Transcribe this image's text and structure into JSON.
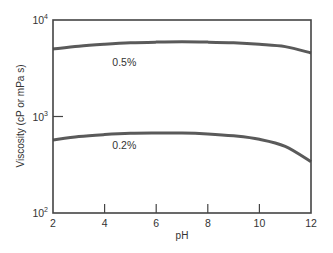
{
  "chart_data": {
    "type": "line",
    "title": "",
    "xlabel": "pH",
    "ylabel": "Viscosity (cP or mPa s)",
    "xlim": [
      2,
      12
    ],
    "ylim": [
      100,
      10000
    ],
    "yscale": "log",
    "xticks": [
      2,
      4,
      6,
      8,
      10,
      12
    ],
    "yticks": [
      {
        "value": 100,
        "base": "10",
        "exp": "2"
      },
      {
        "value": 1000,
        "base": "10",
        "exp": "3"
      },
      {
        "value": 10000,
        "base": "10",
        "exp": "4"
      }
    ],
    "grid": false,
    "legend": "inline labels",
    "series": [
      {
        "name": "0.5%",
        "label_pos": {
          "x": 4.3,
          "y": 3300
        },
        "x": [
          2,
          3,
          4,
          5,
          6,
          7,
          8,
          9,
          10,
          11,
          12
        ],
        "values": [
          5000,
          5350,
          5600,
          5800,
          5900,
          5950,
          5900,
          5800,
          5600,
          5300,
          4550
        ]
      },
      {
        "name": "0.2%",
        "label_pos": {
          "x": 4.3,
          "y": 460
        },
        "x": [
          2,
          3,
          4,
          5,
          6,
          7,
          8,
          9,
          10,
          11,
          12
        ],
        "values": [
          570,
          620,
          650,
          670,
          675,
          675,
          660,
          630,
          580,
          490,
          340
        ]
      }
    ]
  }
}
